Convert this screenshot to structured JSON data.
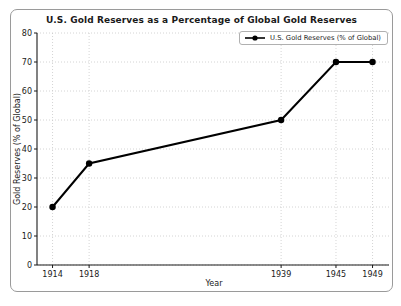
{
  "figure": {
    "background": "#ffffff",
    "border_color": "#9a9a9a"
  },
  "chart_data": {
    "type": "line",
    "title": "U.S. Gold Reserves as a Percentage of Global Gold Reserves",
    "xlabel": "Year",
    "ylabel": "Gold Reserves (% of Global)",
    "x": [
      1914,
      1918,
      1939,
      1945,
      1949
    ],
    "series": [
      {
        "name": "U.S. Gold Reserves (% of Global)",
        "values": [
          20,
          35,
          50,
          70,
          70
        ],
        "color": "#000000",
        "marker": "circle"
      }
    ],
    "legend": [
      "U.S. Gold Reserves (% of Global)"
    ],
    "legend_position": "upper right",
    "grid": true,
    "grid_style": "dotted",
    "grid_color": "#c9c9c9",
    "axis_color": "#1a1a1a",
    "xticks": [
      1914,
      1918,
      1939,
      1945,
      1949
    ],
    "yticks": [
      0,
      10,
      20,
      30,
      40,
      50,
      60,
      70,
      80
    ],
    "xlim": [
      1912.3,
      1950.8
    ],
    "ylim": [
      0,
      80
    ]
  }
}
